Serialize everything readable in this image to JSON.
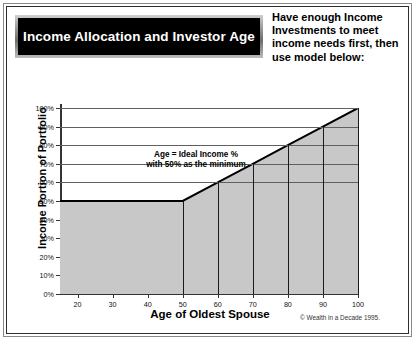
{
  "banner": {
    "title": "Income Allocation and Investor Age",
    "background_color": "#000000",
    "text_color": "#ffffff"
  },
  "header_note": {
    "lines": [
      "Have enough Income",
      "Investments to meet",
      "income needs first, then",
      "use model below:"
    ]
  },
  "footer": {
    "copyright": "© Wealth in a Decade 1995."
  },
  "chart_data": {
    "type": "line",
    "title": "Income Allocation and Investor Age",
    "xlabel": "Age of Oldest Spouse",
    "ylabel": "Income Portion of Portfolio",
    "xlim": [
      15,
      100
    ],
    "ylim": [
      0,
      100
    ],
    "grid": true,
    "legend": "none",
    "fill": "area under curve",
    "fill_color": "#c8c8c8",
    "line_color": "#000000",
    "annotation": {
      "line1": "Age = Ideal Income %",
      "line2": "with 50% as the minimum"
    },
    "x_tick_labels": [
      "20",
      "30",
      "40",
      "50",
      "60",
      "70",
      "80",
      "90",
      "100"
    ],
    "x_ticks": [
      20,
      30,
      40,
      50,
      60,
      70,
      80,
      90,
      100
    ],
    "y_tick_labels": [
      "0%",
      "10%",
      "20%",
      "30%",
      "40%",
      "50%",
      "60%",
      "70%",
      "80%",
      "90%",
      "100%"
    ],
    "y_ticks": [
      0,
      10,
      20,
      30,
      40,
      50,
      60,
      70,
      80,
      90,
      100
    ],
    "x": [
      15,
      50,
      60,
      70,
      80,
      90,
      100
    ],
    "values": [
      50,
      50,
      60,
      70,
      80,
      90,
      100
    ],
    "vertical_dividers": [
      50,
      60,
      70,
      80,
      90,
      100
    ],
    "gridline_levels": [
      60,
      70,
      80,
      90,
      100
    ]
  }
}
